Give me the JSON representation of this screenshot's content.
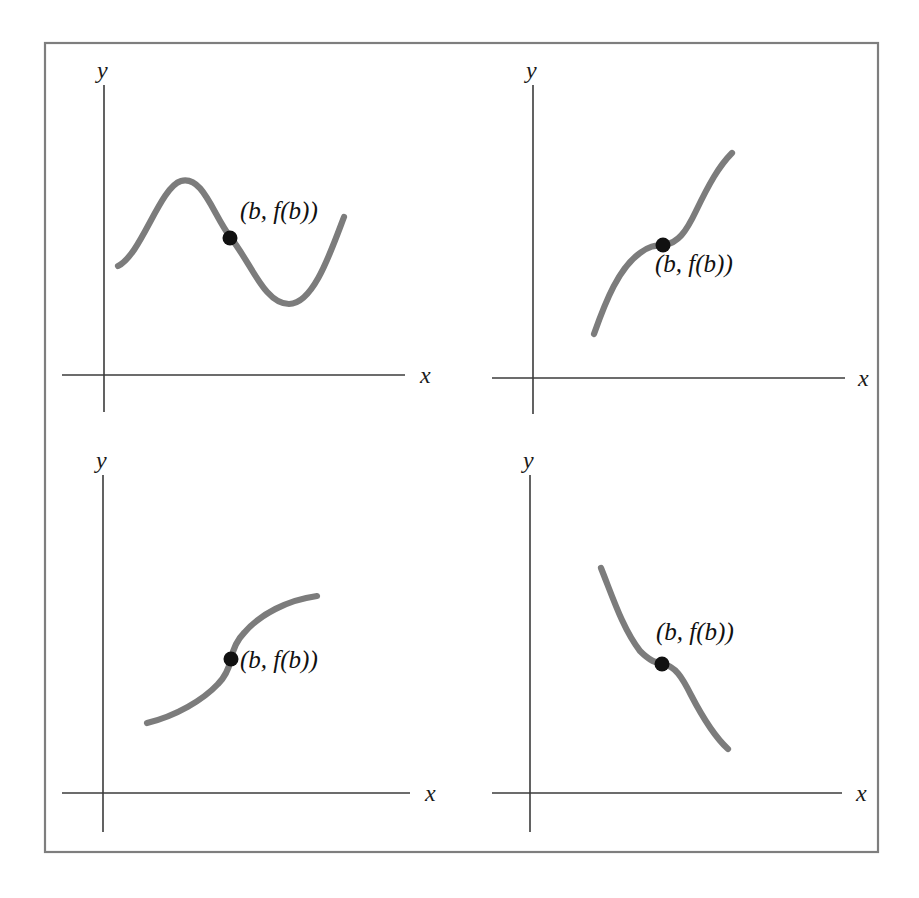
{
  "figure": {
    "background_color": "#ffffff",
    "frame_color": "#7e7e7e",
    "axis_color": "#3b3b3b",
    "curve_color": "#7c7c7c",
    "marker_color": "#111111",
    "frame": {
      "x": 45,
      "y": 43,
      "width": 833,
      "height": 809
    }
  },
  "labels": {
    "x_axis": "x",
    "y_axis": "y",
    "point": "(b, f(b))"
  },
  "chart_data": {
    "type": "line",
    "title": "",
    "xlabel": "x",
    "ylabel": "y",
    "grid": false,
    "legend": null,
    "panel_count": 4,
    "panel_layout": "2x2",
    "annotation": "(b, f(b))",
    "panels": [
      {
        "id": "top-left",
        "position": "top-left",
        "shape": "sinusoidal wave rising then falling then rising",
        "concavity": "concave down then concave up",
        "tangent_at_b": "negative slope",
        "axes": {
          "origin_x": 104,
          "origin_y": 375,
          "y_top": 85,
          "x_right": 405,
          "x_left": 62,
          "y_bottom": 412
        },
        "x_label_pos": {
          "x": 420,
          "y": 383
        },
        "y_label_pos": {
          "x": 97,
          "y": 78
        },
        "marker": {
          "x": 230,
          "y": 238
        },
        "label_pos": {
          "x": 240,
          "y": 219
        },
        "curve": "M118,266 C141,255 160,187 181,181 C203,175 213,215 231,238 C252,265 265,304 289,304 C313,304 330,254 344,217"
      },
      {
        "id": "top-right",
        "position": "top-right",
        "shape": "increasing cubic with horizontal-ish inflection plateau",
        "concavity": "concave down then concave up",
        "tangent_at_b": "small positive slope",
        "axes": {
          "origin_x": 533,
          "origin_y": 378,
          "y_top": 85,
          "x_right": 845,
          "x_left": 492,
          "y_bottom": 414
        },
        "x_label_pos": {
          "x": 858,
          "y": 386
        },
        "y_label_pos": {
          "x": 526,
          "y": 78
        },
        "marker": {
          "x": 663,
          "y": 245
        },
        "label_pos": {
          "x": 655,
          "y": 272
        },
        "curve": "M594,334 C606,300 619,268 640,253 C652,244 658,246 664,245 C678,243 686,232 696,211 C709,184 719,166 732,153"
      },
      {
        "id": "bottom-left",
        "position": "bottom-left",
        "shape": "cube-root style curve with vertical tangent at inflection",
        "concavity": "concave up then concave down",
        "tangent_at_b": "vertical (undefined slope)",
        "axes": {
          "origin_x": 103,
          "origin_y": 793,
          "y_top": 475,
          "x_right": 410,
          "x_left": 62,
          "y_bottom": 832
        },
        "x_label_pos": {
          "x": 425,
          "y": 801
        },
        "y_label_pos": {
          "x": 96,
          "y": 468
        },
        "marker": {
          "x": 231,
          "y": 659
        },
        "label_pos": {
          "x": 240,
          "y": 668
        },
        "curve": "M147,723 C176,716 203,700 218,684 C226,676 229,668 231,659 C233,650 236,641 244,633 C260,614 288,600 317,596"
      },
      {
        "id": "bottom-right",
        "position": "bottom-right",
        "shape": "decreasing cubic with horizontal-ish inflection plateau",
        "concavity": "concave up then concave down",
        "tangent_at_b": "small negative slope",
        "axes": {
          "origin_x": 530,
          "origin_y": 793,
          "y_top": 475,
          "x_right": 842,
          "x_left": 492,
          "y_bottom": 832
        },
        "x_label_pos": {
          "x": 856,
          "y": 801
        },
        "y_label_pos": {
          "x": 523,
          "y": 468
        },
        "marker": {
          "x": 662,
          "y": 664
        },
        "label_pos": {
          "x": 656,
          "y": 640
        },
        "curve": "M601,568 C613,598 623,629 640,651 C650,661 656,663 663,664 C675,666 682,677 691,695 C705,722 716,738 728,749"
      }
    ]
  }
}
